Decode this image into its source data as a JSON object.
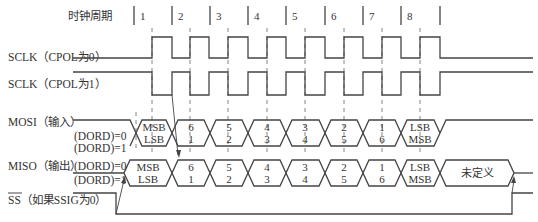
{
  "header": {
    "cycle_label": "时钟周期",
    "cycles": [
      "1",
      "2",
      "3",
      "4",
      "5",
      "6",
      "7",
      "8"
    ]
  },
  "signals": {
    "sclk0": "SCLK（CPOL为0）",
    "sclk1": "SCLK（CPOL为1）",
    "mosi": "MOSI（输入）",
    "miso": "MISO（输出）",
    "ss_bar": "SS",
    "ss_rest": "（如果SSIG为0）"
  },
  "dord": {
    "zero": "(DORD)=0",
    "one": "(DORD)=1"
  },
  "mosi_cells": [
    {
      "top": "MSB",
      "bottom": "LSB"
    },
    {
      "top": "6",
      "bottom": "1"
    },
    {
      "top": "5",
      "bottom": "2"
    },
    {
      "top": "4",
      "bottom": "3"
    },
    {
      "top": "3",
      "bottom": "4"
    },
    {
      "top": "2",
      "bottom": "5"
    },
    {
      "top": "1",
      "bottom": "6"
    },
    {
      "top": "LSB",
      "bottom": "MSB"
    }
  ],
  "miso_cells": [
    {
      "top": "MSB",
      "bottom": "LSB"
    },
    {
      "top": "6",
      "bottom": "1"
    },
    {
      "top": "5",
      "bottom": "2"
    },
    {
      "top": "4",
      "bottom": "3"
    },
    {
      "top": "3",
      "bottom": "4"
    },
    {
      "top": "2",
      "bottom": "5"
    },
    {
      "top": "1",
      "bottom": "6"
    },
    {
      "top": "LSB",
      "bottom": "MSB"
    }
  ],
  "miso_undefined": "未定义",
  "colors": {
    "line": "#444444",
    "text": "#333333",
    "background": "#ffffff"
  }
}
